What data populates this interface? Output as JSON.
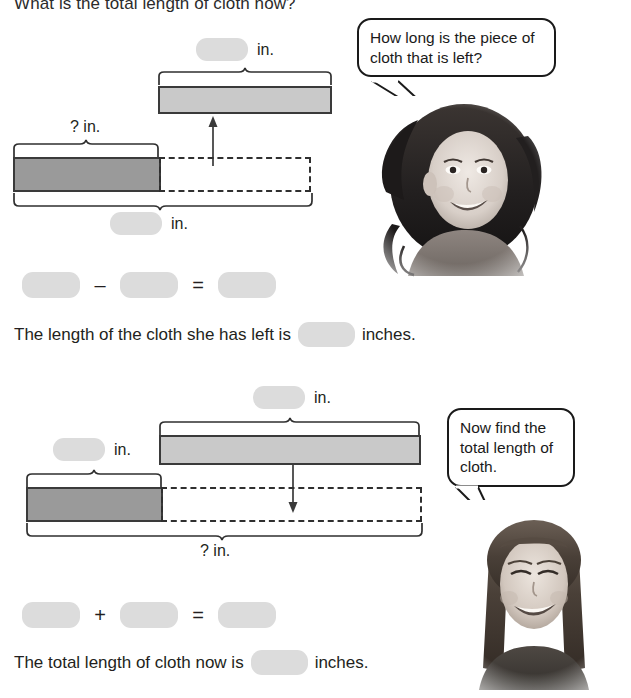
{
  "worksheet": {
    "heading": "What is the total length of cloth now?",
    "unit_label": "in.",
    "question_label": "? in.",
    "blank_value": "",
    "sentence1_before": "The length of the cloth she has left is",
    "sentence1_after": "inches.",
    "sentence2_before": "The total length of cloth now is",
    "sentence2_after": "inches.",
    "equation1": {
      "operator": "–",
      "equals": "="
    },
    "equation2": {
      "operator": "+",
      "equals": "="
    },
    "bubble1": "How long is the piece of cloth that is left?",
    "bubble2": "Now find the total length of cloth.",
    "colors": {
      "bar_light": "#c9c9c9",
      "bar_dark": "#9a9a9a",
      "bar_border": "#3a3a3a",
      "blank_fill": "#dcdcdc",
      "text": "#231f20"
    },
    "diagram1": {
      "top_bar_label": "in.",
      "left_bar_label": "? in.",
      "bottom_bar_label": "in."
    },
    "diagram2": {
      "top_bar_label": "in.",
      "left_bar_label": "in.",
      "total_label": "? in."
    }
  }
}
